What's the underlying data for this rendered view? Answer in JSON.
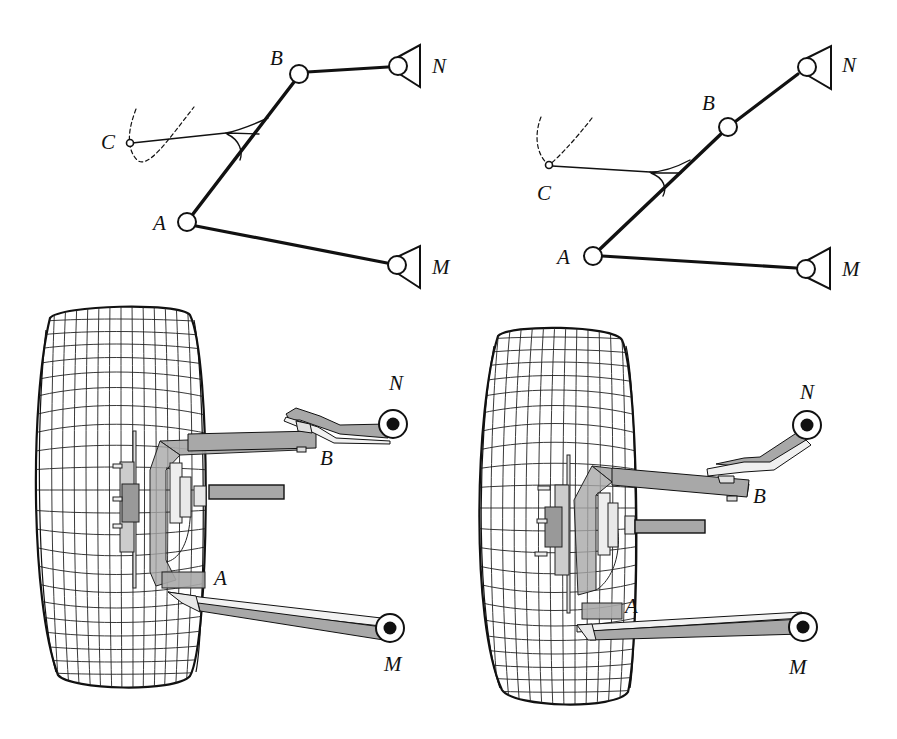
{
  "figure": {
    "colors": {
      "ink": "#111111",
      "arm_fill": "#a8a8a8",
      "arm_light": "#e6e6e6",
      "background": "#ffffff",
      "bushing_core": "#111111"
    }
  },
  "panels": [
    {
      "id": "schematic-left",
      "labels": [
        {
          "text": "B",
          "x": 270,
          "y": 48
        },
        {
          "text": "N",
          "x": 432,
          "y": 56
        },
        {
          "text": "C",
          "x": 101,
          "y": 132
        },
        {
          "text": "A",
          "x": 153,
          "y": 213
        },
        {
          "text": "M",
          "x": 432,
          "y": 257
        }
      ],
      "joints": {
        "A": [
          187,
          222
        ],
        "B": [
          299,
          74
        ],
        "C": [
          130,
          143
        ],
        "N": [
          398,
          66
        ],
        "M": [
          397,
          265
        ]
      }
    },
    {
      "id": "schematic-right",
      "labels": [
        {
          "text": "N",
          "x": 842,
          "y": 55
        },
        {
          "text": "B",
          "x": 702,
          "y": 93
        },
        {
          "text": "C",
          "x": 537,
          "y": 183
        },
        {
          "text": "A",
          "x": 557,
          "y": 247
        },
        {
          "text": "M",
          "x": 842,
          "y": 259
        }
      ],
      "joints": {
        "A": [
          593,
          256
        ],
        "B": [
          728,
          127
        ],
        "C": [
          549,
          165
        ],
        "N": [
          807,
          67
        ],
        "M": [
          806,
          269
        ]
      }
    },
    {
      "id": "wheel-left",
      "labels": [
        {
          "text": "N",
          "x": 389,
          "y": 373
        },
        {
          "text": "B",
          "x": 320,
          "y": 448
        },
        {
          "text": "A",
          "x": 214,
          "y": 568
        },
        {
          "text": "M",
          "x": 384,
          "y": 654
        }
      ]
    },
    {
      "id": "wheel-right",
      "labels": [
        {
          "text": "N",
          "x": 800,
          "y": 382
        },
        {
          "text": "B",
          "x": 753,
          "y": 486
        },
        {
          "text": "A",
          "x": 625,
          "y": 596
        },
        {
          "text": "M",
          "x": 789,
          "y": 657
        }
      ]
    }
  ]
}
